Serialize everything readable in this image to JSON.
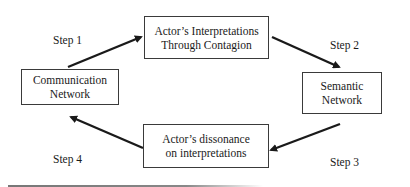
{
  "diagram": {
    "type": "cycle",
    "nodes": [
      {
        "id": "top",
        "lines": [
          "Actor’s Interpretations",
          "Through Contagion"
        ]
      },
      {
        "id": "right",
        "lines": [
          "Semantic",
          "Network"
        ]
      },
      {
        "id": "bottom",
        "lines": [
          "Actor’s dissonance",
          "on interpretations"
        ]
      },
      {
        "id": "left",
        "lines": [
          "Communication",
          "Network"
        ]
      }
    ],
    "edges": [
      {
        "from": "left",
        "to": "top",
        "label": "Step 1"
      },
      {
        "from": "top",
        "to": "right",
        "label": "Step 2"
      },
      {
        "from": "right",
        "to": "bottom",
        "label": "Step 3"
      },
      {
        "from": "bottom",
        "to": "left",
        "label": "Step 4"
      }
    ],
    "colors": {
      "line": "#1a1a1a",
      "box_border": "#3a3a3a",
      "background": "#ffffff"
    }
  }
}
